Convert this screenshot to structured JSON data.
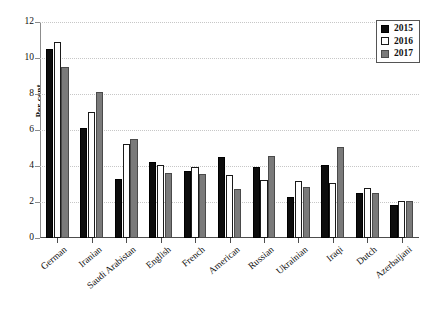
{
  "chart_data": {
    "type": "bar",
    "title": "",
    "xlabel": "",
    "ylabel": "Per cent",
    "ylim": [
      0,
      12
    ],
    "yticks": [
      0,
      2,
      4,
      6,
      8,
      10,
      12
    ],
    "grid": true,
    "legend_position": "top-right",
    "categories": [
      "German",
      "Iranian",
      "Saudi Arabistan",
      "English",
      "French",
      "American",
      "Russian",
      "Ukrainian",
      "Iraqi",
      "Dutch",
      "Azerbaijani"
    ],
    "series": [
      {
        "name": "2015",
        "color": "#0d0d0d",
        "values": [
          10.5,
          6.1,
          3.3,
          4.2,
          3.7,
          4.5,
          3.95,
          2.3,
          4.05,
          2.5,
          1.85
        ]
      },
      {
        "name": "2016",
        "color": "#ffffff",
        "values": [
          10.9,
          7.0,
          5.2,
          4.05,
          3.95,
          3.5,
          3.25,
          3.15,
          3.05,
          2.8,
          2.05
        ]
      },
      {
        "name": "2017",
        "color": "#7a7a7a",
        "values": [
          9.5,
          8.1,
          5.5,
          3.6,
          3.55,
          2.75,
          4.55,
          2.85,
          5.05,
          2.5,
          2.05
        ]
      }
    ]
  }
}
